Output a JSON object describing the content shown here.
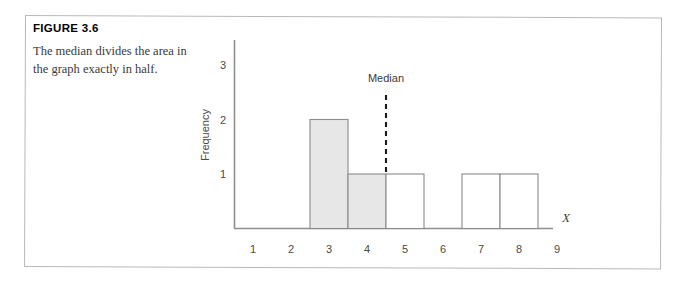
{
  "figure": {
    "number_label": "FIGURE 3.6",
    "caption": "The median divides the area in the graph exactly in half."
  },
  "chart_data": {
    "type": "bar",
    "title": "",
    "xlabel": "X",
    "ylabel": "Frequency",
    "categories": [
      "1",
      "2",
      "3",
      "4",
      "5",
      "6",
      "7",
      "8",
      "9"
    ],
    "values": [
      0,
      0,
      2,
      1,
      1,
      0,
      1,
      1,
      0
    ],
    "bar_fills": [
      "none",
      "none",
      "shaded",
      "shaded",
      "white",
      "none",
      "white",
      "white",
      "none"
    ],
    "xtick_labels": [
      "1",
      "2",
      "3",
      "4",
      "5",
      "6",
      "7",
      "8",
      "9"
    ],
    "ytick_labels": [
      "1",
      "2",
      "3"
    ],
    "ytick_values": [
      1,
      2,
      3
    ],
    "xlim": [
      0.5,
      9.5
    ],
    "ylim": [
      0,
      3.4
    ],
    "grid": false,
    "legend": null,
    "annotations": [
      {
        "text": "Median",
        "type": "vertical-dashed-line",
        "x_value": 4.5,
        "y_from": 1,
        "y_to": 2.45
      }
    ],
    "colors": {
      "bar_fill_shaded": "#e7e7e7",
      "bar_fill_empty": "#ffffff",
      "bar_stroke": "#8a8a8a",
      "axis": "#8e8e8e",
      "median": "#1a1a1a"
    }
  },
  "axis_titles": {
    "y": "Frequency",
    "x": "X"
  },
  "annotation_labels": {
    "median": "Median"
  }
}
